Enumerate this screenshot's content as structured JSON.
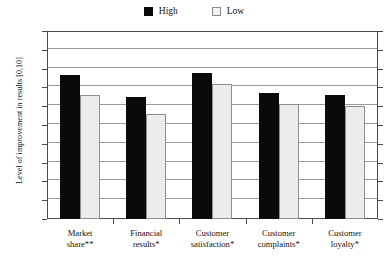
{
  "chart_data": {
    "type": "bar",
    "title": "",
    "xlabel": "",
    "ylabel": "Level of improvement in results [0,10]",
    "ylim": [
      0,
      10
    ],
    "ytick_labels": [
      "10",
      "9",
      "8",
      "7",
      "6",
      "5",
      "4",
      "3",
      "2",
      "1",
      "0"
    ],
    "ytick_values": [
      10,
      9,
      8,
      7,
      6,
      5,
      4,
      3,
      2,
      1,
      0
    ],
    "grid": true,
    "legend_position": "top-center",
    "categories": [
      "Market share**",
      "Financial results*",
      "Customer satisfaction*",
      "Customer complaints*",
      "Customer loyalty*"
    ],
    "series": [
      {
        "name": "High",
        "values": [
          7.65,
          6.5,
          7.75,
          6.7,
          6.6
        ],
        "color": "#0a0a0a"
      },
      {
        "name": "Low",
        "values": [
          6.6,
          5.6,
          7.2,
          6.1,
          6.0
        ],
        "color": "#ececec"
      }
    ]
  },
  "legend": {
    "entries": [
      {
        "label": "High",
        "swatch": "black-square-swatch"
      },
      {
        "label": "Low",
        "swatch": "white-square-swatch"
      }
    ]
  },
  "colors": {
    "high_fill": "#0a0a0a",
    "low_fill": "#ececec",
    "low_border": "#8f8f8f",
    "gridline": "#9a9a9a",
    "axis": "#4a4a4a",
    "background": "#ffffff",
    "text": "#111111"
  }
}
